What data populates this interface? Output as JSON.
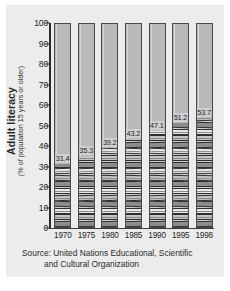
{
  "chart_data": {
    "type": "bar",
    "title": "",
    "subtitle": "",
    "ylabel": "Adult literacy",
    "ylabel_sub": "(% of population 15 years or older)",
    "xlabel": "",
    "categories": [
      "1970",
      "1975",
      "1980",
      "1985",
      "1990",
      "1995",
      "1998"
    ],
    "values": [
      31.4,
      35.3,
      39.2,
      43.2,
      47.1,
      51.2,
      53.7
    ],
    "value_labels": [
      "31.4",
      "35.3",
      "39.2",
      "43.2",
      "47.1",
      "51.2",
      "53.7"
    ],
    "series": [
      {
        "name": "Adult literacy rate",
        "values": [
          31.4,
          35.3,
          39.2,
          43.2,
          47.1,
          51.2,
          53.7
        ]
      }
    ],
    "ylim": [
      0,
      100
    ],
    "ytick_labels": [
      "0",
      "10",
      "20",
      "30",
      "40",
      "50",
      "60",
      "70",
      "80",
      "90",
      "100"
    ],
    "ytick_values": [
      0,
      10,
      20,
      30,
      40,
      50,
      60,
      70,
      80,
      90,
      100
    ],
    "grid": false,
    "legend": false,
    "legend_position": "none",
    "bar_fill_color": "#b9b9b9",
    "bar_outline_color": "#4a4a4a",
    "panel_color": "#ececec",
    "text_color": "#242424",
    "annotation": "Each column is drawn to 100%; the filled lower portion is rendered as a stack of books representing the literacy percentage."
  },
  "source": {
    "line1": "Source: United Nations Educational, Scientific",
    "line2": "and Cultural Organization"
  }
}
